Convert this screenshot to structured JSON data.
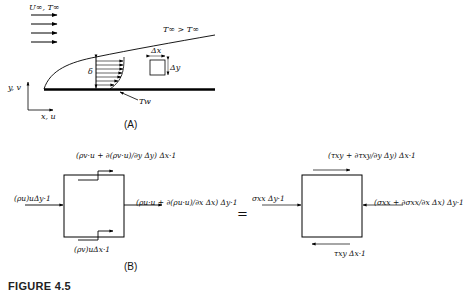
{
  "figure": {
    "caption": "FIGURE 4.5",
    "part_a_label": "(A)",
    "part_b_label": "(B)",
    "equals_sign": "="
  },
  "part_a": {
    "freestream_label": "U∞, T∞",
    "edge_temp_label": "T∞ > T∞",
    "wall_temp_label": "Tw",
    "thickness_label": "δ",
    "element_dx_label": "Δx",
    "element_dy_label": "Δy",
    "axis_y_label": "y, v",
    "axis_x_label": "x, u",
    "freestream_arrow_count": 4,
    "profile_arrow_count": 7
  },
  "part_b_left": {
    "top_flux": "(ρv·u + ∂(ρv·u)/∂y Δy) Δx·1",
    "left_flux": "(ρu)uΔy·1",
    "right_flux": "(ρu·u + ∂(ρu·u)/∂x Δx) Δy·1",
    "bottom_flux": "(ρv)uΔx·1"
  },
  "part_b_right": {
    "top_stress": "(τxy + ∂τxy/∂y Δy) Δx·1",
    "left_stress": "σxx Δy·1",
    "right_stress": "(σxx + ∂σxx/∂x Δx) Δy·1",
    "bottom_stress": "τxy Δx·1"
  }
}
